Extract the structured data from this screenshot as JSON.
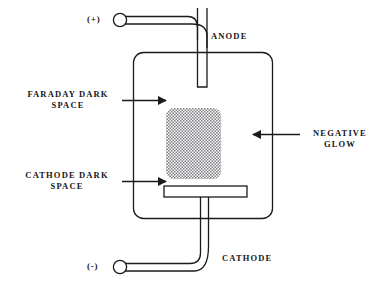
{
  "diagram": {
    "stroke_color": "#1b1b1f",
    "background_color": "#ffffff",
    "glow_fill_color": "#8a8a8a",
    "labels": {
      "anode": "ANODE",
      "cathode": "CATHODE",
      "faraday_dark_space_line1": "FARADAY DARK",
      "faraday_dark_space_line2": "SPACE",
      "cathode_dark_space_line1": "CATHODE DARK",
      "cathode_dark_space_line2": "SPACE",
      "negative_glow_line1": "NEGATIVE",
      "negative_glow_line2": "GLOW"
    },
    "terminals": {
      "positive": "(+)",
      "negative": "(-)"
    }
  }
}
